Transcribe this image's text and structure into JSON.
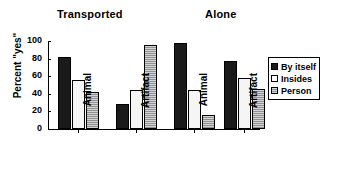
{
  "chart_data": {
    "type": "bar",
    "title": "",
    "xlabel": "",
    "ylabel": "Percent \"yes\"",
    "ylim": [
      0,
      100
    ],
    "yticks": [
      0,
      20,
      40,
      60,
      80,
      100
    ],
    "grid": false,
    "legend_position": "right",
    "panel_titles": [
      "Transported",
      "Alone"
    ],
    "categories": [
      "Animal",
      "Artifact",
      "Animal",
      "Artifact"
    ],
    "group_labels": [
      "Transported / Animal",
      "Transported / Artifact",
      "Alone / Animal",
      "Alone / Artifact"
    ],
    "series": [
      {
        "name": "By itself",
        "color": "#1a1a1a",
        "values": [
          82,
          28,
          98,
          77
        ]
      },
      {
        "name": "Insides",
        "color": "#ffffff",
        "values": [
          56,
          44,
          44,
          58
        ]
      },
      {
        "name": "Person",
        "color": "#a0a0a0",
        "values": [
          42,
          96,
          16,
          46
        ]
      }
    ]
  },
  "panels": [
    {
      "title": "Transported"
    },
    {
      "title": "Alone"
    }
  ],
  "axis": {
    "y_label": "Percent \"yes\"",
    "y_ticks": [
      "0",
      "20",
      "40",
      "60",
      "80",
      "100"
    ],
    "x_ticks": [
      "Animal",
      "Artifact",
      "Animal",
      "Artifact"
    ]
  },
  "legend": {
    "items": [
      {
        "label": "By itself"
      },
      {
        "label": "Insides"
      },
      {
        "label": "Person"
      }
    ]
  }
}
